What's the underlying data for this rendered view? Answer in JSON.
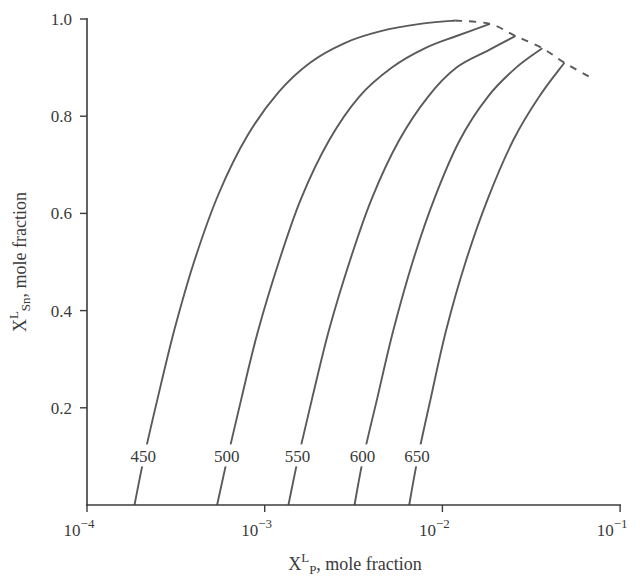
{
  "chart_data": {
    "type": "line",
    "title": "",
    "xlabel": "X^L_P, mole fraction",
    "ylabel": "X^L_Sn, mole fraction",
    "x_scale": "log",
    "xlim": [
      0.0001,
      0.1
    ],
    "ylim": [
      0,
      1.0
    ],
    "grid": false,
    "legend": "inline curve labels",
    "x_ticks": [
      {
        "value": 0.0001,
        "base": "10",
        "exp": "−4"
      },
      {
        "value": 0.001,
        "base": "10",
        "exp": "−3"
      },
      {
        "value": 0.01,
        "base": "10",
        "exp": "−2"
      },
      {
        "value": 0.1,
        "base": "10",
        "exp": "−1"
      }
    ],
    "y_ticks": [
      "0.2",
      "0.4",
      "0.6",
      "0.8",
      "1.0"
    ],
    "series": [
      {
        "name": "450",
        "x": [
          0.000185,
          0.00021,
          0.00025,
          0.00031,
          0.0004,
          0.00055,
          0.0008,
          0.0012,
          0.0018,
          0.0028,
          0.0045,
          0.0075,
          0.0118
        ],
        "y": [
          0.0,
          0.1,
          0.22,
          0.36,
          0.5,
          0.64,
          0.76,
          0.85,
          0.91,
          0.95,
          0.975,
          0.99,
          0.997
        ]
      },
      {
        "name": "500",
        "x": [
          0.00054,
          0.00062,
          0.00074,
          0.00092,
          0.0012,
          0.0016,
          0.0023,
          0.0034,
          0.0052,
          0.008,
          0.012,
          0.0185
        ],
        "y": [
          0.0,
          0.1,
          0.22,
          0.36,
          0.5,
          0.63,
          0.75,
          0.84,
          0.9,
          0.94,
          0.965,
          0.99
        ]
      },
      {
        "name": "550",
        "x": [
          0.00136,
          0.00155,
          0.00185,
          0.0023,
          0.003,
          0.004,
          0.0057,
          0.0083,
          0.012,
          0.018,
          0.0258
        ],
        "y": [
          0.0,
          0.1,
          0.22,
          0.36,
          0.5,
          0.63,
          0.75,
          0.84,
          0.9,
          0.935,
          0.965
        ]
      },
      {
        "name": "600",
        "x": [
          0.0032,
          0.0036,
          0.0043,
          0.0053,
          0.0068,
          0.009,
          0.0125,
          0.018,
          0.026,
          0.0365
        ],
        "y": [
          0.0,
          0.1,
          0.22,
          0.36,
          0.5,
          0.63,
          0.75,
          0.84,
          0.9,
          0.94
        ]
      },
      {
        "name": "650",
        "x": [
          0.0065,
          0.0073,
          0.0086,
          0.0105,
          0.0135,
          0.018,
          0.025,
          0.035,
          0.0486
        ],
        "y": [
          0.0,
          0.1,
          0.22,
          0.36,
          0.5,
          0.63,
          0.75,
          0.84,
          0.91
        ]
      }
    ],
    "dashed_boundary": {
      "x": [
        0.0118,
        0.0185,
        0.0258,
        0.0365,
        0.0486,
        0.068
      ],
      "y": [
        0.997,
        0.99,
        0.965,
        0.94,
        0.91,
        0.88
      ]
    },
    "curve_labels": [
      "450",
      "500",
      "550",
      "600",
      "650"
    ],
    "colors": {
      "line": "#5a5a5a",
      "axis": "#3c3c3c",
      "text": "#3a3a3a",
      "background": "#ffffff"
    }
  }
}
